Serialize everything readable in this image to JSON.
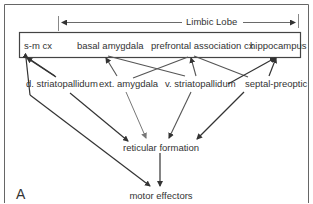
{
  "diagram": {
    "panel_label": "A",
    "bracket_label": "Limbic Lobe",
    "top_row": [
      {
        "id": "smcx",
        "label": "s-m cx"
      },
      {
        "id": "basal_amygdala",
        "label": "basal amygdala"
      },
      {
        "id": "prefrontal",
        "label": "prefrontal association cx"
      },
      {
        "id": "hippocampus",
        "label": "hippocampus"
      }
    ],
    "middle_row": [
      {
        "id": "d_striatopallidum",
        "label": "d. striatopallidum"
      },
      {
        "id": "ext_amygdala",
        "label": "ext. amygdala"
      },
      {
        "id": "v_striatopallidum",
        "label": "v. striatopallidum"
      },
      {
        "id": "septal_preoptic",
        "label": "septal-preoptic"
      }
    ],
    "reticular": {
      "id": "reticular_formation",
      "label": "reticular formation"
    },
    "motor": {
      "id": "motor_effectors",
      "label": "motor effectors"
    },
    "edges": [
      {
        "from": "s-m cx",
        "to": "d. striatopallidum"
      },
      {
        "from": "s-m cx",
        "to": "motor effectors"
      },
      {
        "from": "basal amygdala",
        "to": "ext. amygdala"
      },
      {
        "from": "basal amygdala",
        "to": "v. striatopallidum"
      },
      {
        "from": "prefrontal association cx",
        "to": "ext. amygdala"
      },
      {
        "from": "prefrontal association cx",
        "to": "v. striatopallidum"
      },
      {
        "from": "prefrontal association cx",
        "to": "septal-preoptic"
      },
      {
        "from": "hippocampus",
        "to": "v. striatopallidum"
      },
      {
        "from": "hippocampus",
        "to": "septal-preoptic"
      },
      {
        "from": "d. striatopallidum",
        "to": "reticular formation"
      },
      {
        "from": "ext. amygdala",
        "to": "reticular formation"
      },
      {
        "from": "v. striatopallidum",
        "to": "reticular formation"
      },
      {
        "from": "septal-preoptic",
        "to": "reticular formation"
      },
      {
        "from": "reticular formation",
        "to": "motor effectors"
      }
    ],
    "colors": {
      "line_dark": "#333333",
      "line_gray": "#777777",
      "frame": "#666666"
    }
  }
}
